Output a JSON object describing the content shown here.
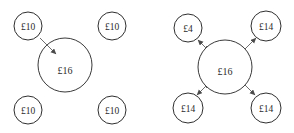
{
  "figure": {
    "type": "diagram",
    "currency_symbol": "£",
    "colors": {
      "background": "#ffffff",
      "circle_stroke": "#2f2f2f",
      "arrow_stroke": "#6e6e6e",
      "text": "#2b2b2b"
    }
  },
  "diagrams": [
    {
      "id": "left-diagram",
      "name": "before-transfer",
      "center": {
        "label": "£16",
        "value": 16,
        "cx": 65,
        "cy": 65,
        "r": 27
      },
      "nodes": [
        {
          "id": "left-top-left",
          "label": "£10",
          "value": 10,
          "cx": 28,
          "cy": 26,
          "r": 14
        },
        {
          "id": "left-top-right",
          "label": "£10",
          "value": 10,
          "cx": 112,
          "cy": 26,
          "r": 14
        },
        {
          "id": "left-bottom-left",
          "label": "£10",
          "value": 10,
          "cx": 28,
          "cy": 110,
          "r": 14
        },
        {
          "id": "left-bottom-right",
          "label": "£10",
          "value": 10,
          "cx": 112,
          "cy": 110,
          "r": 14
        }
      ],
      "arrows": [
        {
          "id": "left-arrow-inbound",
          "from": "left-top-left",
          "to": "center",
          "direction": "inward",
          "x1": 40,
          "y1": 38,
          "x2": 56,
          "y2": 54
        }
      ]
    },
    {
      "id": "right-diagram",
      "name": "after-transfer",
      "center": {
        "label": "£16",
        "value": 16,
        "cx": 225,
        "cy": 67,
        "r": 27
      },
      "nodes": [
        {
          "id": "right-top-left",
          "label": "£4",
          "value": 4,
          "cx": 188,
          "cy": 28,
          "r": 14
        },
        {
          "id": "right-top-right",
          "label": "£14",
          "value": 14,
          "cx": 266,
          "cy": 26,
          "r": 15
        },
        {
          "id": "right-bottom-left",
          "label": "£14",
          "value": 14,
          "cx": 188,
          "cy": 108,
          "r": 15
        },
        {
          "id": "right-bottom-right",
          "label": "£14",
          "value": 14,
          "cx": 266,
          "cy": 108,
          "r": 15
        }
      ],
      "arrows": [
        {
          "id": "right-arrow-top-left",
          "from": "center",
          "to": "right-top-left",
          "direction": "outward",
          "x1": 244,
          "y1": 86,
          "x2": 198,
          "y2": 40
        },
        {
          "id": "right-arrow-top-right",
          "from": "center",
          "to": "right-top-right",
          "direction": "outward",
          "x1": 206,
          "y1": 88,
          "x2": 256,
          "y2": 38
        },
        {
          "id": "right-arrow-bottom-left",
          "from": "center",
          "to": "right-bottom-left",
          "direction": "outward",
          "x1": 244,
          "y1": 48,
          "x2": 197,
          "y2": 95
        },
        {
          "id": "right-arrow-bottom-right",
          "from": "center",
          "to": "right-bottom-right",
          "direction": "outward",
          "x1": 206,
          "y1": 46,
          "x2": 255,
          "y2": 95
        }
      ]
    }
  ]
}
